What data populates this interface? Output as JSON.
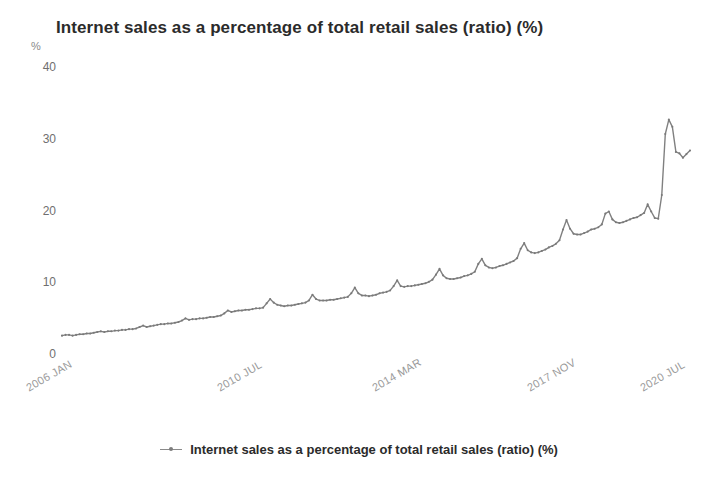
{
  "chart_data": {
    "type": "line",
    "title": "Internet sales as a percentage of total retail sales (ratio) (%)",
    "xlabel": "",
    "ylabel": "%",
    "yunit": "%",
    "ylim": [
      0,
      40
    ],
    "yticks": [
      0,
      10,
      20,
      30,
      40
    ],
    "ytick_labels": [
      "0",
      "10",
      "20",
      "30",
      "40"
    ],
    "xtick_labels": [
      "2006 JAN",
      "2010 JUL",
      "2014 MAR",
      "2017 NOV",
      "2020 JUL"
    ],
    "xtick_indices": [
      0,
      54,
      98,
      142,
      174
    ],
    "grid": false,
    "legend_position": "bottom-center",
    "legend": [
      "Internet sales as a percentage of total retail sales (ratio) (%)"
    ],
    "line_color": "#808080",
    "series": [
      {
        "name": "Internet sales as a percentage of total retail sales (ratio) (%)",
        "x": [
          "2006 JAN",
          "2006 FEB",
          "2006 MAR",
          "2006 APR",
          "2006 MAY",
          "2006 JUN",
          "2006 JUL",
          "2006 AUG",
          "2006 SEP",
          "2006 OCT",
          "2006 NOV",
          "2006 DEC",
          "2007 JAN",
          "2007 FEB",
          "2007 MAR",
          "2007 APR",
          "2007 MAY",
          "2007 JUN",
          "2007 JUL",
          "2007 AUG",
          "2007 SEP",
          "2007 OCT",
          "2007 NOV",
          "2007 DEC",
          "2008 JAN",
          "2008 FEB",
          "2008 MAR",
          "2008 APR",
          "2008 MAY",
          "2008 JUN",
          "2008 JUL",
          "2008 AUG",
          "2008 SEP",
          "2008 OCT",
          "2008 NOV",
          "2008 DEC",
          "2009 JAN",
          "2009 FEB",
          "2009 MAR",
          "2009 APR",
          "2009 MAY",
          "2009 JUN",
          "2009 JUL",
          "2009 AUG",
          "2009 SEP",
          "2009 OCT",
          "2009 NOV",
          "2009 DEC",
          "2010 JAN",
          "2010 FEB",
          "2010 MAR",
          "2010 APR",
          "2010 MAY",
          "2010 JUN",
          "2010 JUL",
          "2010 AUG",
          "2010 SEP",
          "2010 OCT",
          "2010 NOV",
          "2010 DEC",
          "2011 JAN",
          "2011 FEB",
          "2011 MAR",
          "2011 APR",
          "2011 MAY",
          "2011 JUN",
          "2011 JUL",
          "2011 AUG",
          "2011 SEP",
          "2011 OCT",
          "2011 NOV",
          "2011 DEC",
          "2012 JAN",
          "2012 FEB",
          "2012 MAR",
          "2012 APR",
          "2012 MAY",
          "2012 JUN",
          "2012 JUL",
          "2012 AUG",
          "2012 SEP",
          "2012 OCT",
          "2012 NOV",
          "2012 DEC",
          "2013 JAN",
          "2013 FEB",
          "2013 MAR",
          "2013 APR",
          "2013 MAY",
          "2013 JUN",
          "2013 JUL",
          "2013 AUG",
          "2013 SEP",
          "2013 OCT",
          "2013 NOV",
          "2013 DEC",
          "2014 JAN",
          "2014 FEB",
          "2014 MAR",
          "2014 APR",
          "2014 MAY",
          "2014 JUN",
          "2014 JUL",
          "2014 AUG",
          "2014 SEP",
          "2014 OCT",
          "2014 NOV",
          "2014 DEC",
          "2015 JAN",
          "2015 FEB",
          "2015 MAR",
          "2015 APR",
          "2015 MAY",
          "2015 JUN",
          "2015 JUL",
          "2015 AUG",
          "2015 SEP",
          "2015 OCT",
          "2015 NOV",
          "2015 DEC",
          "2016 JAN",
          "2016 FEB",
          "2016 MAR",
          "2016 APR",
          "2016 MAY",
          "2016 JUN",
          "2016 JUL",
          "2016 AUG",
          "2016 SEP",
          "2016 OCT",
          "2016 NOV",
          "2016 DEC",
          "2017 JAN",
          "2017 FEB",
          "2017 MAR",
          "2017 APR",
          "2017 MAY",
          "2017 JUN",
          "2017 JUL",
          "2017 AUG",
          "2017 SEP",
          "2017 OCT",
          "2017 NOV",
          "2017 DEC",
          "2018 JAN",
          "2018 FEB",
          "2018 MAR",
          "2018 APR",
          "2018 MAY",
          "2018 JUN",
          "2018 JUL",
          "2018 AUG",
          "2018 SEP",
          "2018 OCT",
          "2018 NOV",
          "2018 DEC",
          "2019 JAN",
          "2019 FEB",
          "2019 MAR",
          "2019 APR",
          "2019 MAY",
          "2019 JUN",
          "2019 JUL",
          "2019 AUG",
          "2019 SEP",
          "2019 OCT",
          "2019 NOV",
          "2019 DEC",
          "2020 JAN",
          "2020 FEB",
          "2020 MAR",
          "2020 APR",
          "2020 MAY",
          "2020 JUN",
          "2020 JUL",
          "2020 AUG",
          "2020 SEP",
          "2020 OCT",
          "2020 NOV"
        ],
        "values": [
          2.7,
          2.8,
          2.8,
          2.7,
          2.8,
          2.9,
          2.9,
          3.0,
          3.0,
          3.1,
          3.2,
          3.3,
          3.2,
          3.3,
          3.3,
          3.4,
          3.4,
          3.5,
          3.5,
          3.6,
          3.6,
          3.7,
          3.9,
          4.1,
          3.9,
          4.0,
          4.1,
          4.2,
          4.3,
          4.3,
          4.4,
          4.4,
          4.5,
          4.6,
          4.8,
          5.1,
          4.9,
          5.0,
          5.0,
          5.1,
          5.1,
          5.2,
          5.3,
          5.3,
          5.4,
          5.5,
          5.8,
          6.2,
          6.0,
          6.1,
          6.2,
          6.2,
          6.3,
          6.3,
          6.4,
          6.5,
          6.5,
          6.6,
          7.2,
          7.8,
          7.3,
          7.0,
          6.9,
          6.8,
          6.9,
          6.9,
          7.0,
          7.1,
          7.2,
          7.3,
          7.6,
          8.4,
          7.8,
          7.6,
          7.6,
          7.6,
          7.7,
          7.7,
          7.8,
          7.9,
          8.0,
          8.1,
          8.6,
          9.4,
          8.6,
          8.3,
          8.3,
          8.2,
          8.3,
          8.4,
          8.6,
          8.7,
          8.8,
          9.0,
          9.6,
          10.4,
          9.6,
          9.5,
          9.6,
          9.6,
          9.7,
          9.8,
          9.9,
          10.0,
          10.2,
          10.5,
          11.2,
          12.0,
          11.1,
          10.7,
          10.6,
          10.6,
          10.7,
          10.8,
          11.0,
          11.1,
          11.3,
          11.6,
          12.7,
          13.4,
          12.5,
          12.2,
          12.1,
          12.2,
          12.4,
          12.5,
          12.7,
          12.9,
          13.1,
          13.5,
          14.8,
          15.6,
          14.6,
          14.3,
          14.2,
          14.3,
          14.5,
          14.7,
          15.0,
          15.2,
          15.5,
          16.0,
          17.5,
          18.8,
          17.6,
          16.9,
          16.8,
          16.8,
          17.0,
          17.2,
          17.5,
          17.6,
          17.8,
          18.2,
          19.7,
          20.0,
          18.9,
          18.5,
          18.4,
          18.5,
          18.7,
          18.9,
          19.1,
          19.2,
          19.5,
          19.8,
          21.0,
          20.0,
          19.1,
          19.0,
          22.3,
          30.8,
          32.8,
          31.8,
          28.3,
          28.1,
          27.5,
          28.0,
          28.5
        ]
      }
    ]
  },
  "legend": {
    "label": "Internet sales as a percentage of total retail sales (ratio) (%)"
  }
}
